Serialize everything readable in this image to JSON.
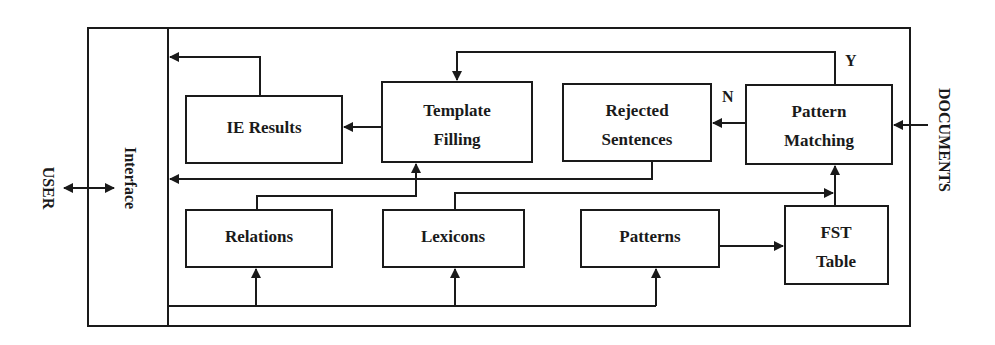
{
  "diagram": {
    "external": {
      "user": "USER",
      "documents": "DOCUMENTS"
    },
    "interface": {
      "label": "Interface"
    },
    "nodes": {
      "ie_results": {
        "line1": "IE Results"
      },
      "template_filling": {
        "line1": "Template",
        "line2": "Filling"
      },
      "rejected_sentences": {
        "line1": "Rejected",
        "line2": "Sentences"
      },
      "pattern_matching": {
        "line1": "Pattern",
        "line2": "Matching"
      },
      "relations": {
        "line1": "Relations"
      },
      "lexicons": {
        "line1": "Lexicons"
      },
      "patterns": {
        "line1": "Patterns"
      },
      "fst_table": {
        "line1": "FST",
        "line2": "Table"
      }
    },
    "edge_labels": {
      "yes": "Y",
      "no": "N"
    },
    "edges": [
      {
        "from": "USER",
        "to": "Interface",
        "bidirectional": true
      },
      {
        "from": "DOCUMENTS",
        "to": "Pattern Matching"
      },
      {
        "from": "Pattern Matching",
        "to": "Rejected Sentences",
        "label": "N"
      },
      {
        "from": "Pattern Matching",
        "to": "Template Filling",
        "label": "Y"
      },
      {
        "from": "Template Filling",
        "to": "IE Results"
      },
      {
        "from": "IE Results",
        "to": "Interface"
      },
      {
        "from": "Rejected Sentences",
        "to": "Interface"
      },
      {
        "from": "Relations",
        "to": "Template Filling"
      },
      {
        "from": "Lexicons",
        "to": "Pattern Matching"
      },
      {
        "from": "Patterns",
        "to": "FST Table"
      },
      {
        "from": "FST Table",
        "to": "Pattern Matching"
      },
      {
        "from": "Interface",
        "to": "Relations"
      },
      {
        "from": "Interface",
        "to": "Lexicons"
      },
      {
        "from": "Interface",
        "to": "Patterns"
      }
    ]
  }
}
